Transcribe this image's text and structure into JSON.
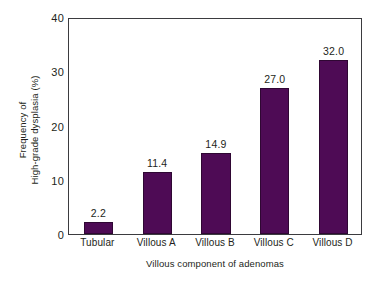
{
  "chart_data": {
    "type": "bar",
    "title": "",
    "subtitle": "",
    "categories": [
      "Tubular",
      "Villous A",
      "Villous B",
      "Villous C",
      "Villous D"
    ],
    "values": [
      2.2,
      11.4,
      14.9,
      27.0,
      32.0
    ],
    "value_labels": [
      "2.2",
      "11.4",
      "14.9",
      "27.0",
      "32.0"
    ],
    "xlabel": "Villous component of adenomas",
    "ylabel_line1": "Frequency of",
    "ylabel_line2": "High-grade dysplasia (%)",
    "ylabel": "Frequency of High-grade dysplasia (%)",
    "ylim": [
      0,
      40
    ],
    "yticks": [
      0,
      10,
      20,
      30,
      40
    ],
    "ytick_labels": [
      "0",
      "10",
      "20",
      "30",
      "40"
    ],
    "grid": false,
    "legend": false,
    "legend_position": "none",
    "bar_color": "#4E0B55",
    "bar_edge_color": "#2F0733",
    "axis_color": "#3B3B3F",
    "text_color": "#231F20",
    "background_color": "#FFFFFF",
    "series": [
      {
        "name": "High-grade dysplasia frequency",
        "values": [
          2.2,
          11.4,
          14.9,
          27.0,
          32.0
        ]
      }
    ],
    "points": [
      {
        "category": "Tubular",
        "value": 2.2,
        "label": "2.2"
      },
      {
        "category": "Villous A",
        "value": 11.4,
        "label": "11.4"
      },
      {
        "category": "Villous B",
        "value": 14.9,
        "label": "14.9"
      },
      {
        "category": "Villous C",
        "value": 27.0,
        "label": "27.0"
      },
      {
        "category": "Villous D",
        "value": 32.0,
        "label": "32.0"
      }
    ]
  }
}
